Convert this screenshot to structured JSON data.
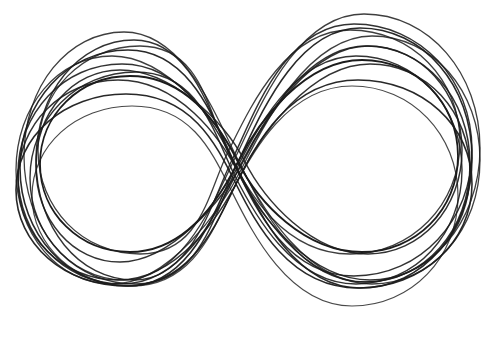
{
  "image": {
    "width": 499,
    "height": 343,
    "background": "#ffffff",
    "subject": "hand-drawn figure-eight / infinity scribble",
    "stroke_color": "#1c1c1c"
  },
  "loops": [
    {
      "lcx": 128,
      "lcy": 168,
      "lrx": 108,
      "lry": 118,
      "rcx": 360,
      "rcy": 158,
      "rrx": 112,
      "rry": 130,
      "cross_x": 236,
      "cross_y": 166,
      "width": 1.6,
      "opacity": 0.95
    },
    {
      "lcx": 122,
      "lcy": 174,
      "lrx": 104,
      "lry": 110,
      "rcx": 366,
      "rcy": 164,
      "rrx": 104,
      "rry": 118,
      "cross_x": 238,
      "cross_y": 170,
      "width": 1.5,
      "opacity": 0.9
    },
    {
      "lcx": 134,
      "lcy": 160,
      "lrx": 98,
      "lry": 120,
      "rcx": 354,
      "rcy": 150,
      "rrx": 118,
      "rry": 126,
      "cross_x": 232,
      "cross_y": 160,
      "width": 1.4,
      "opacity": 0.9
    },
    {
      "lcx": 118,
      "lcy": 180,
      "lrx": 100,
      "lry": 100,
      "rcx": 370,
      "rcy": 172,
      "rrx": 100,
      "rry": 108,
      "cross_x": 240,
      "cross_y": 176,
      "width": 1.5,
      "opacity": 0.9
    },
    {
      "lcx": 140,
      "lcy": 150,
      "lrx": 102,
      "lry": 104,
      "rcx": 350,
      "rcy": 142,
      "rrx": 110,
      "rry": 112,
      "cross_x": 228,
      "cross_y": 152,
      "width": 1.3,
      "opacity": 0.85
    },
    {
      "lcx": 126,
      "lcy": 190,
      "lrx": 110,
      "lry": 96,
      "rcx": 358,
      "rcy": 184,
      "rrx": 114,
      "rry": 104,
      "cross_x": 236,
      "cross_y": 184,
      "width": 1.6,
      "opacity": 0.95
    },
    {
      "lcx": 130,
      "lcy": 164,
      "lrx": 90,
      "lry": 88,
      "rcx": 362,
      "rcy": 156,
      "rrx": 96,
      "rry": 96,
      "cross_x": 238,
      "cross_y": 162,
      "width": 1.8,
      "opacity": 1.0
    },
    {
      "lcx": 112,
      "lcy": 170,
      "lrx": 96,
      "lry": 114,
      "rcx": 372,
      "rcy": 160,
      "rrx": 108,
      "rry": 124,
      "cross_x": 242,
      "cross_y": 168,
      "width": 1.3,
      "opacity": 0.85
    },
    {
      "lcx": 136,
      "lcy": 178,
      "lrx": 106,
      "lry": 106,
      "rcx": 356,
      "rcy": 170,
      "rrx": 106,
      "rry": 114,
      "cross_x": 234,
      "cross_y": 174,
      "width": 1.4,
      "opacity": 0.9
    },
    {
      "lcx": 124,
      "lcy": 156,
      "lrx": 100,
      "lry": 124,
      "rcx": 364,
      "rcy": 148,
      "rrx": 116,
      "rry": 134,
      "cross_x": 236,
      "cross_y": 156,
      "width": 1.3,
      "opacity": 0.85
    },
    {
      "lcx": 132,
      "lcy": 196,
      "lrx": 100,
      "lry": 90,
      "rcx": 352,
      "rcy": 196,
      "rrx": 106,
      "rry": 110,
      "cross_x": 232,
      "cross_y": 192,
      "width": 1.2,
      "opacity": 0.8
    },
    {
      "lcx": 120,
      "lcy": 166,
      "lrx": 84,
      "lry": 96,
      "rcx": 368,
      "rcy": 150,
      "rrx": 94,
      "rry": 104,
      "cross_x": 244,
      "cross_y": 160,
      "width": 1.5,
      "opacity": 0.9
    }
  ]
}
